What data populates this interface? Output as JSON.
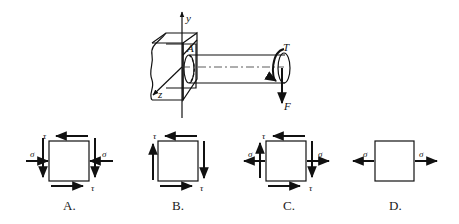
{
  "figure": {
    "top": {
      "labels": {
        "y_axis": "y",
        "z_axis": "z",
        "point": "A",
        "torque": "T",
        "force": "F"
      }
    },
    "options": [
      {
        "letter": "A.",
        "sigma_left": "σ",
        "sigma_right": "σ",
        "tau_top": "τ",
        "tau_bottom": "τ",
        "sigma_direction": "compressive",
        "has_shear": true
      },
      {
        "letter": "B.",
        "tau_top": "τ",
        "tau_bottom": "τ",
        "has_shear": true,
        "has_normal": false
      },
      {
        "letter": "C.",
        "sigma_left": "σ",
        "sigma_right": "σ",
        "tau_top": "τ",
        "tau_bottom": "τ",
        "sigma_direction": "tensile",
        "has_shear": true
      },
      {
        "letter": "D.",
        "sigma_left": "σ",
        "sigma_right": "σ",
        "sigma_direction": "tensile",
        "has_shear": false
      }
    ]
  }
}
